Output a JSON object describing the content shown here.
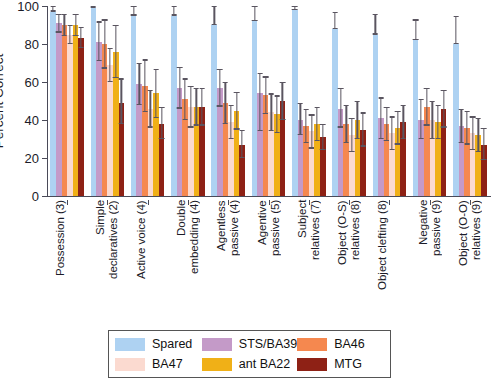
{
  "chart_data": {
    "type": "bar",
    "title": "",
    "xlabel": "",
    "ylabel": "Percent Correct",
    "ylim": [
      0,
      100
    ],
    "yticks": [
      0,
      20,
      40,
      60,
      80,
      100
    ],
    "grid": false,
    "legend_position": "bottom",
    "categories": [
      "Possession (3)",
      "Simple\ndeclaratives (2)",
      "Active voice (4)",
      "Double\nembedding (4)",
      "Agentless\npassive (4)",
      "Agentive\npassive (5)",
      "Subject\nrelatives (7)",
      "Object (O-S)\nrelatives (8)",
      "Object clefting (8)",
      "Negative\npassive (9)",
      "Object (O-O)\nrelatives (9)"
    ],
    "series": [
      {
        "name": "Spared",
        "color": "#aed2f2",
        "values": [
          97,
          99,
          95,
          95,
          90,
          92,
          98,
          88,
          85,
          82,
          80
        ],
        "err_low": [
          97,
          99,
          95,
          95,
          90,
          92,
          98,
          88,
          85,
          82,
          80
        ],
        "err_high": [
          100,
          100,
          100,
          100,
          100,
          100,
          100,
          97,
          96,
          93,
          95
        ]
      },
      {
        "name": "STS/BA39",
        "color": "#c49ac8",
        "values": [
          91,
          81,
          59,
          57,
          57,
          54,
          40,
          46,
          41,
          40,
          37
        ],
        "err_low": [
          86,
          71,
          48,
          46,
          47,
          34,
          32,
          36,
          30,
          30,
          28
        ],
        "err_high": [
          96,
          92,
          70,
          68,
          67,
          65,
          49,
          57,
          52,
          51,
          46
        ]
      },
      {
        "name": "BA46",
        "color": "#f5884f",
        "values": [
          90,
          80,
          58,
          51,
          49,
          53,
          37,
          38,
          38,
          47,
          36
        ],
        "err_low": [
          84,
          67,
          44,
          40,
          38,
          43,
          28,
          28,
          29,
          37,
          27
        ],
        "err_high": [
          96,
          93,
          72,
          62,
          60,
          63,
          46,
          48,
          47,
          57,
          45
        ]
      },
      {
        "name": "BA47",
        "color": "#fbdad0",
        "values": [
          85,
          69,
          46,
          47,
          39,
          44,
          34,
          32,
          33,
          40,
          33
        ],
        "err_low": [
          80,
          60,
          36,
          36,
          30,
          34,
          25,
          23,
          24,
          30,
          24
        ],
        "err_high": [
          90,
          78,
          56,
          58,
          48,
          54,
          43,
          41,
          42,
          50,
          42
        ]
      },
      {
        "name": "ant BA22",
        "color": "#f0b017",
        "values": [
          90,
          76,
          54,
          47,
          45,
          43,
          38,
          40,
          36,
          39,
          32
        ],
        "err_low": [
          84,
          62,
          41,
          37,
          35,
          33,
          29,
          30,
          27,
          30,
          23
        ],
        "err_high": [
          96,
          90,
          67,
          57,
          55,
          53,
          47,
          50,
          45,
          48,
          41
        ]
      },
      {
        "name": "MTG",
        "color": "#8e2115",
        "values": [
          83,
          49,
          38,
          47,
          27,
          50,
          31,
          35,
          39,
          46,
          27
        ],
        "err_low": [
          78,
          38,
          30,
          37,
          20,
          40,
          24,
          26,
          30,
          36,
          19
        ],
        "err_high": [
          89,
          62,
          47,
          57,
          35,
          60,
          38,
          44,
          48,
          56,
          36
        ]
      }
    ]
  },
  "legend": {
    "items": [
      {
        "label": "Spared",
        "color": "#aed2f2"
      },
      {
        "label": "STS/BA39",
        "color": "#c49ac8"
      },
      {
        "label": "BA46",
        "color": "#f5884f"
      },
      {
        "label": "BA47",
        "color": "#fbdad0"
      },
      {
        "label": "ant BA22",
        "color": "#f0b017"
      },
      {
        "label": "MTG",
        "color": "#8e2115"
      }
    ]
  }
}
